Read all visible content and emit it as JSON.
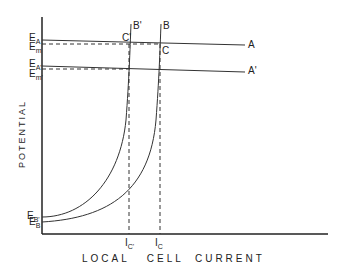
{
  "diagram": {
    "xlabel": "LOCAL   CELL  CURRENT",
    "ylabel": "POTENTIAL",
    "y_ticks": {
      "EA": {
        "main": "E",
        "sub": "A"
      },
      "Em": {
        "main": "E",
        "sub": "m"
      },
      "EA2": {
        "main": "E",
        "sub": "A'"
      },
      "Em2": {
        "main": "E",
        "sub": "m'"
      },
      "EB2": {
        "main": "E",
        "sub": "B'"
      },
      "EB": {
        "main": "E",
        "sub": "B"
      }
    },
    "x_ticks": {
      "Ic2": {
        "main": "I",
        "sub": "C'"
      },
      "Ic": {
        "main": "I",
        "sub": "C"
      }
    },
    "curve_labels": {
      "A": "A",
      "A2": "A'",
      "B": "B",
      "B2": "B'",
      "C": "C",
      "C2": "C'"
    }
  }
}
